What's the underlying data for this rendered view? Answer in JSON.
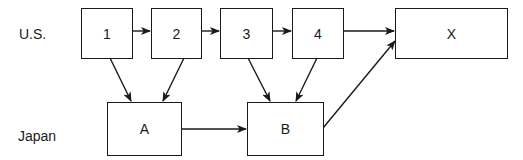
{
  "diagram": {
    "rows": [
      {
        "id": "us",
        "label": "U.S."
      },
      {
        "id": "japan",
        "label": "Japan"
      }
    ],
    "nodes": [
      {
        "id": "1",
        "label": "1",
        "row": "us"
      },
      {
        "id": "2",
        "label": "2",
        "row": "us"
      },
      {
        "id": "3",
        "label": "3",
        "row": "us"
      },
      {
        "id": "4",
        "label": "4",
        "row": "us"
      },
      {
        "id": "X",
        "label": "X",
        "row": "us"
      },
      {
        "id": "A",
        "label": "A",
        "row": "japan"
      },
      {
        "id": "B",
        "label": "B",
        "row": "japan"
      }
    ],
    "edges": [
      {
        "from": "1",
        "to": "2"
      },
      {
        "from": "2",
        "to": "3"
      },
      {
        "from": "3",
        "to": "4"
      },
      {
        "from": "4",
        "to": "X"
      },
      {
        "from": "1",
        "to": "A"
      },
      {
        "from": "2",
        "to": "A"
      },
      {
        "from": "3",
        "to": "B"
      },
      {
        "from": "4",
        "to": "B"
      },
      {
        "from": "A",
        "to": "B"
      },
      {
        "from": "B",
        "to": "X"
      }
    ],
    "colors": {
      "stroke": "#1a1a1a",
      "background": "#ffffff"
    }
  }
}
